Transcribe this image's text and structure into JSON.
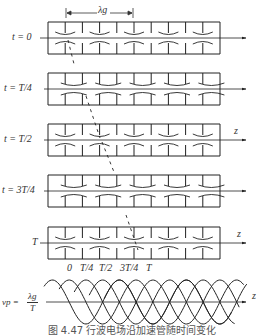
{
  "figure": {
    "wavelength_label": "λg",
    "axis_label": "z",
    "rows": [
      {
        "label": "t = 0",
        "axis_y": 38
      },
      {
        "label": "t = T/4",
        "axis_y": 89
      },
      {
        "label": "t = T/2",
        "axis_y": 140
      },
      {
        "label": "t = 3T/4",
        "axis_y": 191
      },
      {
        "label": "T",
        "axis_y": 243
      }
    ],
    "time_ticks": [
      "0",
      "T/4",
      "T/2",
      "3T/4",
      "T"
    ],
    "phase_velocity_formula": {
      "lhs": "vp =",
      "numerator": "λg",
      "denominator": "T"
    },
    "caption": "图 4.47   行波电场沿加速管随时间变化"
  }
}
